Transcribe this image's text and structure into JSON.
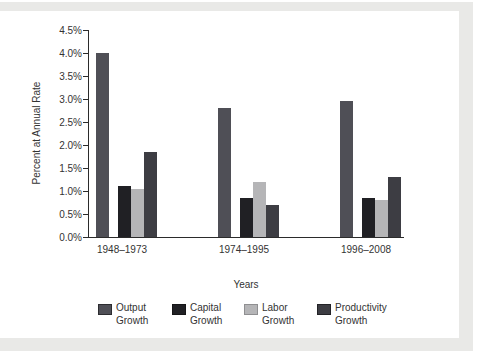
{
  "colors": {
    "page_band": "#e9e9e7",
    "axis": "#2b2b2b",
    "text": "#333333"
  },
  "chart_data": {
    "type": "bar",
    "title": "",
    "xlabel": "Years",
    "ylabel": "Percent at Annual Rate",
    "categories": [
      "1948–1973",
      "1974–1995",
      "1996–2008"
    ],
    "series": [
      {
        "name": "Output Growth",
        "color": "#4f4f56",
        "border": "#2c2c30",
        "values": [
          4.0,
          2.8,
          2.95
        ]
      },
      {
        "name": "Capital Growth",
        "color": "#202024",
        "border": "#151517",
        "values": [
          1.1,
          0.85,
          0.85
        ]
      },
      {
        "name": "Labor Growth",
        "color": "#b5b5b7",
        "border": "#8f8f91",
        "values": [
          1.05,
          1.2,
          0.8
        ]
      },
      {
        "name": "Productivity Growth",
        "color": "#3d3d43",
        "border": "#232327",
        "values": [
          1.85,
          0.7,
          1.3
        ]
      }
    ],
    "ylim": [
      0,
      4.5
    ],
    "ytick_step": 0.5,
    "ytick_labels": [
      "0.0%",
      "0.5%",
      "1.0%",
      "1.5%",
      "2.0%",
      "2.5%",
      "3.0%",
      "3.5%",
      "4.0%",
      "4.5%"
    ],
    "grid": false,
    "legend_position": "bottom"
  },
  "legend": {
    "items": [
      {
        "line1": "Output",
        "line2": "Growth"
      },
      {
        "line1": "Capital",
        "line2": "Growth"
      },
      {
        "line1": "Labor",
        "line2": "Growth"
      },
      {
        "line1": "Productivity",
        "line2": "Growth"
      }
    ]
  }
}
